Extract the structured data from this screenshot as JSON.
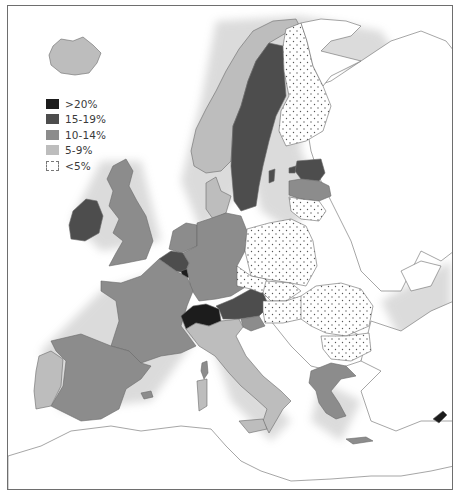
{
  "map": {
    "title": "",
    "legend": [
      {
        "label": ">20%",
        "color": "#1c1c1c",
        "pattern": "solid"
      },
      {
        "label": "15-19%",
        "color": "#4d4d4d",
        "pattern": "solid"
      },
      {
        "label": "10-14%",
        "color": "#8c8c8c",
        "pattern": "solid"
      },
      {
        "label": "5-9%",
        "color": "#bdbdbd",
        "pattern": "solid"
      },
      {
        "label": "<5%",
        "color": "#ffffff",
        "pattern": "dotted"
      }
    ],
    "regions": [
      {
        "name": "Iceland",
        "class": "5-9%"
      },
      {
        "name": "Norway",
        "class": "5-9%"
      },
      {
        "name": "Sweden",
        "class": "15-19%"
      },
      {
        "name": "Finland",
        "class": "<5%"
      },
      {
        "name": "Estonia",
        "class": "15-19%"
      },
      {
        "name": "Latvia",
        "class": "10-14%"
      },
      {
        "name": "Lithuania",
        "class": "<5%"
      },
      {
        "name": "Denmark",
        "class": "5-9%"
      },
      {
        "name": "Ireland",
        "class": "15-19%"
      },
      {
        "name": "United Kingdom",
        "class": "10-14%"
      },
      {
        "name": "Netherlands",
        "class": "10-14%"
      },
      {
        "name": "Belgium",
        "class": "15-19%"
      },
      {
        "name": "Luxembourg",
        "class": ">20%"
      },
      {
        "name": "Germany",
        "class": "10-14%"
      },
      {
        "name": "France",
        "class": "10-14%"
      },
      {
        "name": "Switzerland",
        "class": ">20%"
      },
      {
        "name": "Austria",
        "class": "15-19%"
      },
      {
        "name": "Slovenia",
        "class": "10-14%"
      },
      {
        "name": "Italy",
        "class": "5-9%"
      },
      {
        "name": "Spain",
        "class": "10-14%"
      },
      {
        "name": "Portugal",
        "class": "5-9%"
      },
      {
        "name": "Poland",
        "class": "<5%"
      },
      {
        "name": "Czech Republic",
        "class": "<5%"
      },
      {
        "name": "Slovakia",
        "class": "<5%"
      },
      {
        "name": "Hungary",
        "class": "<5%"
      },
      {
        "name": "Romania",
        "class": "<5%"
      },
      {
        "name": "Bulgaria",
        "class": "<5%"
      },
      {
        "name": "Greece",
        "class": "10-14%"
      },
      {
        "name": "Cyprus",
        "class": ">20%"
      }
    ]
  }
}
